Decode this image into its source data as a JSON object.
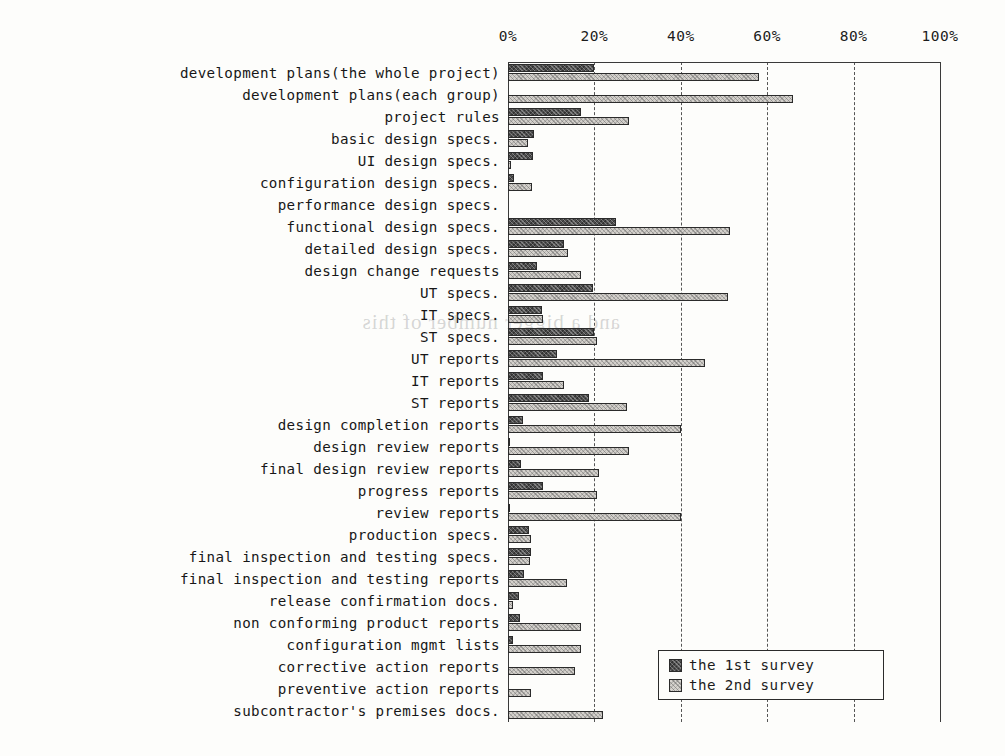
{
  "chart_data": {
    "type": "bar",
    "orientation": "horizontal",
    "title": "",
    "xlabel": "",
    "ylabel": "",
    "xlim": [
      0,
      100
    ],
    "xticks": [
      "0%",
      "20%",
      "40%",
      "60%",
      "80%",
      "100%"
    ],
    "xtick_values": [
      0,
      20,
      40,
      60,
      80,
      100
    ],
    "grid": "vertical-dashed",
    "legend_position": "bottom-right",
    "categories": [
      "development plans(the whole project)",
      "development plans(each group)",
      "project rules",
      "basic design specs.",
      "UI design specs.",
      "configuration design specs.",
      "performance design specs.",
      "functional design specs.",
      "detailed design specs.",
      "design change requests",
      "UT specs.",
      "IT specs.",
      "ST specs.",
      "UT reports",
      "IT reports",
      "ST reports",
      "design completion reports",
      "design review reports",
      "final design review reports",
      "progress reports",
      "review reports",
      "production specs.",
      "final inspection and testing specs.",
      "final inspection and testing reports",
      "release confirmation docs.",
      "non conforming product reports",
      "configuration mgmt lists",
      "corrective action reports",
      "preventive action reports",
      "subcontractor's premises docs."
    ],
    "series": [
      {
        "name": "the 1st survey",
        "color": "#4d4d4d",
        "values": [
          20,
          0,
          17,
          6,
          5.8,
          1.4,
          0,
          25,
          13,
          6.7,
          19.7,
          7.8,
          20,
          11.4,
          8,
          18.8,
          3.4,
          0.5,
          3,
          8.2,
          0.5,
          4.9,
          5.4,
          3.7,
          2.6,
          2.8,
          1.2,
          0,
          0,
          0
        ]
      },
      {
        "name": "the 2nd survey",
        "color": "#d3d0cb",
        "values": [
          58,
          66,
          28,
          4.6,
          0.7,
          5.6,
          0,
          51.4,
          14,
          17,
          51,
          8.2,
          20.6,
          45.6,
          13,
          27.5,
          40,
          28,
          21,
          20.6,
          40,
          5.4,
          5,
          13.6,
          1.2,
          17,
          17,
          15.5,
          5.4,
          22
        ]
      }
    ]
  },
  "legend": {
    "items": [
      {
        "label": "the 1st survey",
        "swatch": "dark-hatch-swatch"
      },
      {
        "label": "the 2nd survey",
        "swatch": "light-hatch-swatch"
      }
    ]
  },
  "artifacts": {
    "bleed_through_text": "and a bigger number of this"
  }
}
